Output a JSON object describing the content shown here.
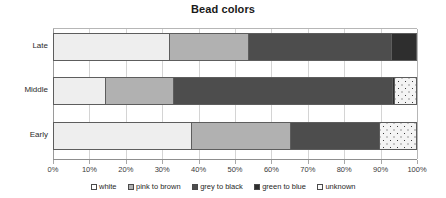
{
  "chart_data": {
    "type": "bar",
    "orientation": "horizontal",
    "stacked": true,
    "title": "Bead colors",
    "xlabel": "",
    "ylabel": "",
    "xlim": [
      0,
      100
    ],
    "grid": true,
    "legend_position": "bottom",
    "categories": [
      "Late",
      "Middle",
      "Early"
    ],
    "category_order_top_to_bottom": [
      "Late",
      "Middle",
      "Early"
    ],
    "xtick_labels": [
      "0%",
      "10%",
      "20%",
      "30%",
      "40%",
      "50%",
      "60%",
      "70%",
      "80%",
      "90%",
      "100%"
    ],
    "xtick_values": [
      0,
      10,
      20,
      30,
      40,
      50,
      60,
      70,
      80,
      90,
      100
    ],
    "series": [
      {
        "name": "white",
        "color": "#eeeeee",
        "values": [
          32.0,
          14.2,
          38.0
        ]
      },
      {
        "name": "pink to brown",
        "color": "#b1b1b1",
        "values": [
          21.5,
          18.8,
          27.0
        ]
      },
      {
        "name": "grey to black",
        "color": "#4d4d4d",
        "values": [
          39.5,
          60.0,
          24.5
        ]
      },
      {
        "name": "green to blue",
        "color": "#2e2e2e",
        "values": [
          7.0,
          0.8,
          0.0
        ]
      },
      {
        "name": "unknown",
        "color": "#f4f4f4",
        "values": [
          0.0,
          6.2,
          10.5
        ]
      }
    ]
  },
  "legend": {
    "items": [
      {
        "label": "white"
      },
      {
        "label": "pink to brown"
      },
      {
        "label": "grey to black"
      },
      {
        "label": "green to blue"
      },
      {
        "label": "unknown"
      }
    ]
  }
}
